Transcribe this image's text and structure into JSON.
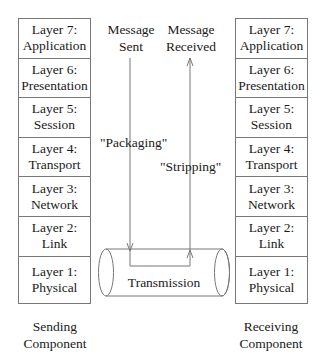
{
  "diagram": {
    "sending_stack": {
      "layers": [
        {
          "line1": "Layer 7:",
          "line2": "Application"
        },
        {
          "line1": "Layer 6:",
          "line2": "Presentation"
        },
        {
          "line1": "Layer 5:",
          "line2": "Session"
        },
        {
          "line1": "Layer 4:",
          "line2": "Transport"
        },
        {
          "line1": "Layer 3:",
          "line2": "Network"
        },
        {
          "line1": "Layer 2:",
          "line2": "Link"
        },
        {
          "line1": "Layer 1:",
          "line2": "Physical"
        }
      ],
      "caption_line1": "Sending",
      "caption_line2": "Component"
    },
    "receiving_stack": {
      "layers": [
        {
          "line1": "Layer 7:",
          "line2": "Application"
        },
        {
          "line1": "Layer 6:",
          "line2": "Presentation"
        },
        {
          "line1": "Layer 5:",
          "line2": "Session"
        },
        {
          "line1": "Layer 4:",
          "line2": "Transport"
        },
        {
          "line1": "Layer 3:",
          "line2": "Network"
        },
        {
          "line1": "Layer 2:",
          "line2": "Link"
        },
        {
          "line1": "Layer 1:",
          "line2": "Physical"
        }
      ],
      "caption_line1": "Receiving",
      "caption_line2": "Component"
    },
    "labels": {
      "message_sent_line1": "Message",
      "message_sent_line2": "Sent",
      "message_received_line1": "Message",
      "message_received_line2": "Received",
      "packaging": "\"Packaging\"",
      "stripping": "\"Stripping\"",
      "transmission": "Transmission"
    },
    "colors": {
      "line": "#777777",
      "text": "#1a1a1a"
    }
  }
}
